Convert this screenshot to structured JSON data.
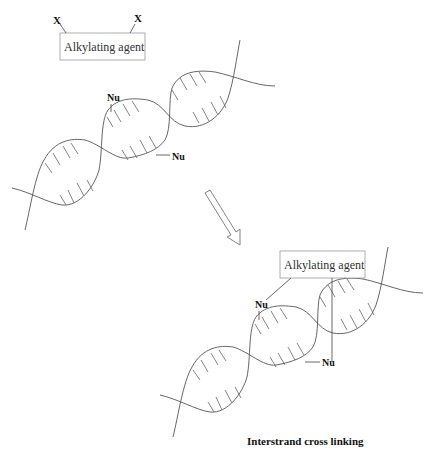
{
  "diagram": {
    "before": {
      "agent_box_label": "Alkylating agent",
      "leaving_groups": [
        "X",
        "X"
      ],
      "nucleophile_labels": [
        "Nu",
        "Nu"
      ]
    },
    "arrow": {
      "direction": "down-right"
    },
    "after": {
      "agent_box_label": "Alkylating agent",
      "nucleophile_labels": [
        "Nu",
        "Nu"
      ],
      "caption": "Interstrand cross linking"
    }
  }
}
